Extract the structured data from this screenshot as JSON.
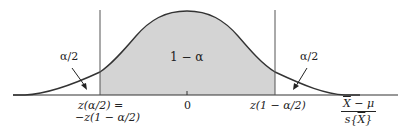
{
  "diagram": {
    "type": "normal-distribution-two-sided-interval",
    "colors": {
      "curve": "#333333",
      "shaded_region": "#d4d4d4",
      "axis": "#333333",
      "background": "#ffffff"
    },
    "labels": {
      "center_region": "1 − α",
      "left_tail": "α/2",
      "right_tail": "α/2",
      "center_tick": "0",
      "left_critical_line1": "z(α/2) =",
      "left_critical_line2": "−z(1 − α/2)",
      "right_critical": "z(1 − α/2)",
      "axis_variable_numerator": "X̄ − μ",
      "axis_variable_numerator_x": "X",
      "axis_variable_numerator_rest": " − μ",
      "axis_variable_denominator_prefix": "s{",
      "axis_variable_denominator_x": "X",
      "axis_variable_denominator_suffix": "}"
    }
  }
}
